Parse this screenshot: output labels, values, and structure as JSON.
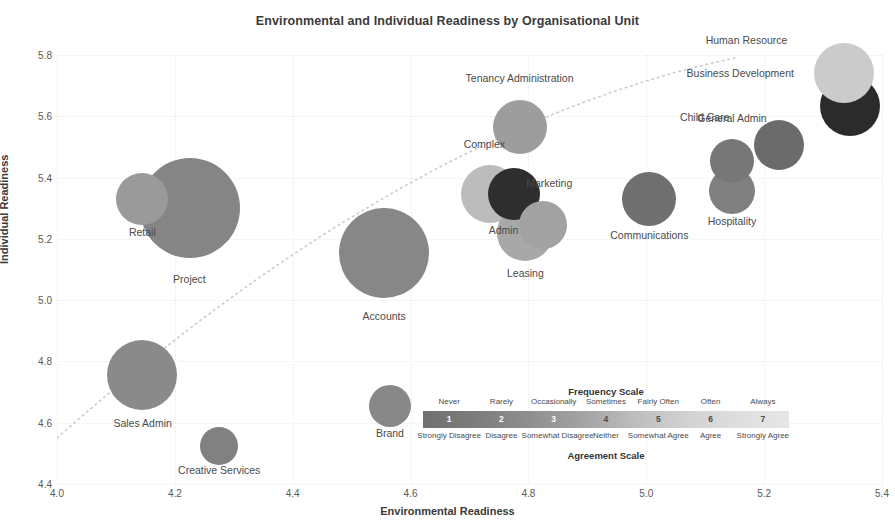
{
  "chart_data": {
    "type": "scatter",
    "title": "Environmental and Individual Readiness by Organisational Unit",
    "xlabel": "Environmental Readiness",
    "ylabel": "Individual Readiness",
    "xlim": [
      4.0,
      5.4
    ],
    "ylim": [
      4.4,
      5.8
    ],
    "xticks": [
      "4.0",
      "4.2",
      "4.4",
      "4.6",
      "4.8",
      "5.0",
      "5.2",
      "5.4"
    ],
    "yticks": [
      "4.4",
      "4.6",
      "4.8",
      "5.0",
      "5.2",
      "5.4",
      "5.6",
      "5.8"
    ],
    "grid": true,
    "legend_position": "inside-bottom-right",
    "bubble_note": "Bubble size encodes unit headcount; bubble shade encodes readiness score on the 1-7 frequency/agreement scale",
    "trendline": {
      "style": "dotted",
      "color": "#cccccc",
      "start": {
        "x": 4.0,
        "y": 4.55
      },
      "end": {
        "x": 5.15,
        "y": 5.79
      }
    },
    "points": [
      {
        "label": "Retail",
        "x": 4.145,
        "y": 5.33,
        "size": 26,
        "color": "#9a9a9a",
        "label_dx": 0,
        "label_dy": 22,
        "label_anchor": "center"
      },
      {
        "label": "Project",
        "x": 4.225,
        "y": 5.3,
        "size": 50,
        "color": "#858585",
        "label_dx": 0,
        "label_dy": 36,
        "label_anchor": "center"
      },
      {
        "label": "Sales Admin",
        "x": 4.145,
        "y": 4.755,
        "size": 35,
        "color": "#8a8a8a",
        "label_dx": 0,
        "label_dy": 28,
        "label_anchor": "center"
      },
      {
        "label": "Creative Services",
        "x": 4.275,
        "y": 4.525,
        "size": 19,
        "color": "#818181",
        "label_dx": 0,
        "label_dy": 20,
        "label_anchor": "center"
      },
      {
        "label": "Accounts",
        "x": 4.555,
        "y": 5.155,
        "size": 45,
        "color": "#878787",
        "label_dx": 0,
        "label_dy": 33,
        "label_anchor": "center"
      },
      {
        "label": "Brand",
        "x": 4.565,
        "y": 4.655,
        "size": 21,
        "color": "#888888",
        "label_dx": 0,
        "label_dy": 21,
        "label_anchor": "center"
      },
      {
        "label": "Tenancy Administration",
        "x": 4.785,
        "y": 5.565,
        "size": 27,
        "color": "#9d9d9d",
        "label_dx": 0,
        "label_dy": -21,
        "label_anchor": "center"
      },
      {
        "label": "Complex",
        "x": 4.735,
        "y": 5.345,
        "size": 29,
        "color": "#bcbcbc",
        "label_dx": -6,
        "label_dy": -20,
        "label_anchor": "center"
      },
      {
        "label": "Admin",
        "x": 4.775,
        "y": 5.345,
        "size": 26,
        "color": "#2e2e2e",
        "label_dx": -10,
        "label_dy": 25,
        "label_anchor": "center"
      },
      {
        "label": "Leasing",
        "x": 4.795,
        "y": 5.22,
        "size": 28,
        "color": "#a8a8a8",
        "label_dx": 0,
        "label_dy": 27,
        "label_anchor": "center"
      },
      {
        "label": "Marketing",
        "x": 4.825,
        "y": 5.245,
        "size": 24,
        "color": "#a2a2a2",
        "label_dx": 6,
        "label_dy": -17,
        "label_anchor": "center"
      },
      {
        "label": "Communications",
        "x": 5.005,
        "y": 5.33,
        "size": 27,
        "color": "#6f6f6f",
        "label_dx": 0,
        "label_dy": 24,
        "label_anchor": "center"
      },
      {
        "label": "Hospitality",
        "x": 5.145,
        "y": 5.355,
        "size": 23,
        "color": "#808080",
        "label_dx": 0,
        "label_dy": 22,
        "label_anchor": "center"
      },
      {
        "label": "General Admin",
        "x": 5.145,
        "y": 5.455,
        "size": 22,
        "color": "#777777",
        "label_dx": 0,
        "label_dy": -20,
        "label_anchor": "center"
      },
      {
        "label": "Child Care",
        "x": 5.225,
        "y": 5.505,
        "size": 25,
        "color": "#6b6b6b",
        "label_dx": -24,
        "label_dy": -2,
        "label_anchor": "right"
      },
      {
        "label": "Business Development",
        "x": 5.345,
        "y": 5.635,
        "size": 30,
        "color": "#2b2b2b",
        "label_dx": -26,
        "label_dy": -2,
        "label_anchor": "right"
      },
      {
        "label": "Human Resource",
        "x": 5.335,
        "y": 5.74,
        "size": 30,
        "color": "#cbcbcb",
        "label_dx": -26,
        "label_dy": -2,
        "label_anchor": "right"
      }
    ]
  },
  "legend": {
    "top_title": "Frequency Scale",
    "bottom_title": "Agreement Scale",
    "steps": [
      {
        "number": "1",
        "frequency": "Never",
        "agreement": "Strongly Disagree",
        "color": "#737373",
        "text_color": "light"
      },
      {
        "number": "2",
        "frequency": "Rarely",
        "agreement": "Disagree",
        "color": "#8a8a8a",
        "text_color": "light"
      },
      {
        "number": "3",
        "frequency": "Occasionally",
        "agreement": "Somewhat Disagree",
        "color": "#a0a0a0",
        "text_color": "light"
      },
      {
        "number": "4",
        "frequency": "Sometimes",
        "agreement": "Neither",
        "color": "#bababa",
        "text_color": "dark"
      },
      {
        "number": "5",
        "frequency": "Fairly Often",
        "agreement": "Somewhat Agree",
        "color": "#d0d0d0",
        "text_color": "dark"
      },
      {
        "number": "6",
        "frequency": "Often",
        "agreement": "Agree",
        "color": "#dfdfdf",
        "text_color": "dark"
      },
      {
        "number": "7",
        "frequency": "Always",
        "agreement": "Strongly Agree",
        "color": "#e8e8e8",
        "text_color": "dark"
      }
    ]
  }
}
